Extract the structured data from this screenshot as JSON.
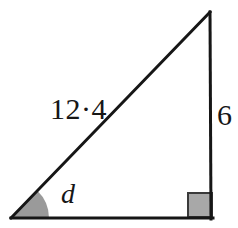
{
  "figure": {
    "kind": "right-triangle-diagram",
    "background_color": "#ffffff",
    "stroke_color": "#161616",
    "stroke_width": 3,
    "labels": {
      "hypotenuse": "12·4",
      "vertical_side": "6",
      "angle": "d"
    },
    "angle_marker": {
      "name": "angle-sector",
      "fill_color": "#9a9a9a",
      "stroke_color": "#161616",
      "radius": 38
    },
    "right_angle_marker": {
      "name": "right-angle-square",
      "fill_color": "#a8a8a8",
      "stroke_color": "#3a3a3a",
      "size": 24
    },
    "vertices": {
      "bottom_left": {
        "x": 11,
        "y": 218
      },
      "bottom_right": {
        "x": 213,
        "y": 218
      },
      "top_right": {
        "x": 210,
        "y": 12
      }
    }
  }
}
